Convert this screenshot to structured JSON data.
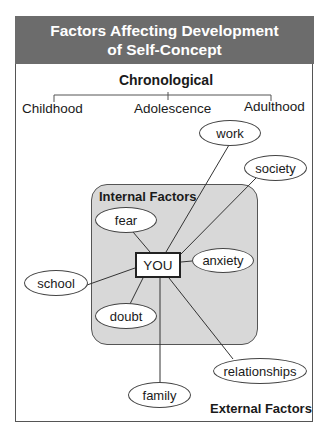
{
  "header": {
    "title_line1": "Factors Affecting Development",
    "title_line2": "of Self-Concept"
  },
  "chronological": {
    "title": "Chronological",
    "stages": [
      "Childhood",
      "Adolescence",
      "Adulthood"
    ]
  },
  "internal": {
    "label": "Internal Factors",
    "factors": [
      "fear",
      "anxiety",
      "doubt"
    ]
  },
  "center": {
    "label": "YOU"
  },
  "external": {
    "label": "External Factors",
    "factors": [
      "work",
      "society",
      "school",
      "family",
      "relationships"
    ]
  },
  "colors": {
    "header_bg": "#6c6c6c",
    "internal_bg": "#d8d8d8",
    "line": "#333333"
  }
}
